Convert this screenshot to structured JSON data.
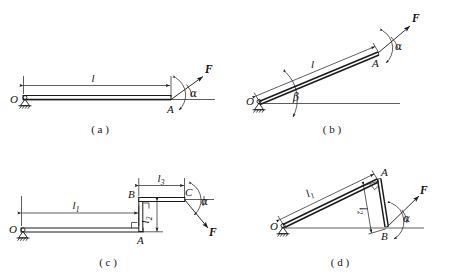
{
  "document": {
    "title": "Four rigid-body statics figures with applied force F",
    "figure_count": 4
  },
  "figures": [
    {
      "id": "a",
      "caption": "( a )",
      "description": "Horizontal bar OA pinned at O, force F applied at free end A",
      "labels": {
        "pivot": "O",
        "end": "A",
        "length": "l",
        "force": "F",
        "angle": "α"
      }
    },
    {
      "id": "b",
      "caption": "( b )",
      "description": "Inclined bar OA pinned at O at angle beta to horizontal, force F at A",
      "labels": {
        "pivot": "O",
        "end": "A",
        "length": "l",
        "force": "F",
        "angle": "α",
        "incline_angle": "β"
      }
    },
    {
      "id": "c",
      "caption": "( c )",
      "description": "Stepped bent bar O-A-B-C pinned at O, force F applied at C",
      "labels": {
        "pivot": "O",
        "corner_lower": "A",
        "corner_upper": "B",
        "end": "C",
        "length_1": "l",
        "length_1_sub": "1",
        "length_2": "l",
        "length_2_sub": "2",
        "length_3": "l",
        "length_3_sub": "3",
        "force": "F",
        "angle": "α"
      }
    },
    {
      "id": "d",
      "caption": "( d )",
      "description": "Bent bar O-A-B pinned at O, inclined member OA and member AB, force F at B",
      "labels": {
        "pivot": "O",
        "corner": "A",
        "end": "B",
        "length_1": "l",
        "length_1_sub": "1",
        "length_2": "l",
        "length_2_sub": "2",
        "force": "F",
        "angle": "α"
      }
    }
  ],
  "colors": {
    "ink": "#1a1a1a",
    "paper": "#ffffff"
  }
}
